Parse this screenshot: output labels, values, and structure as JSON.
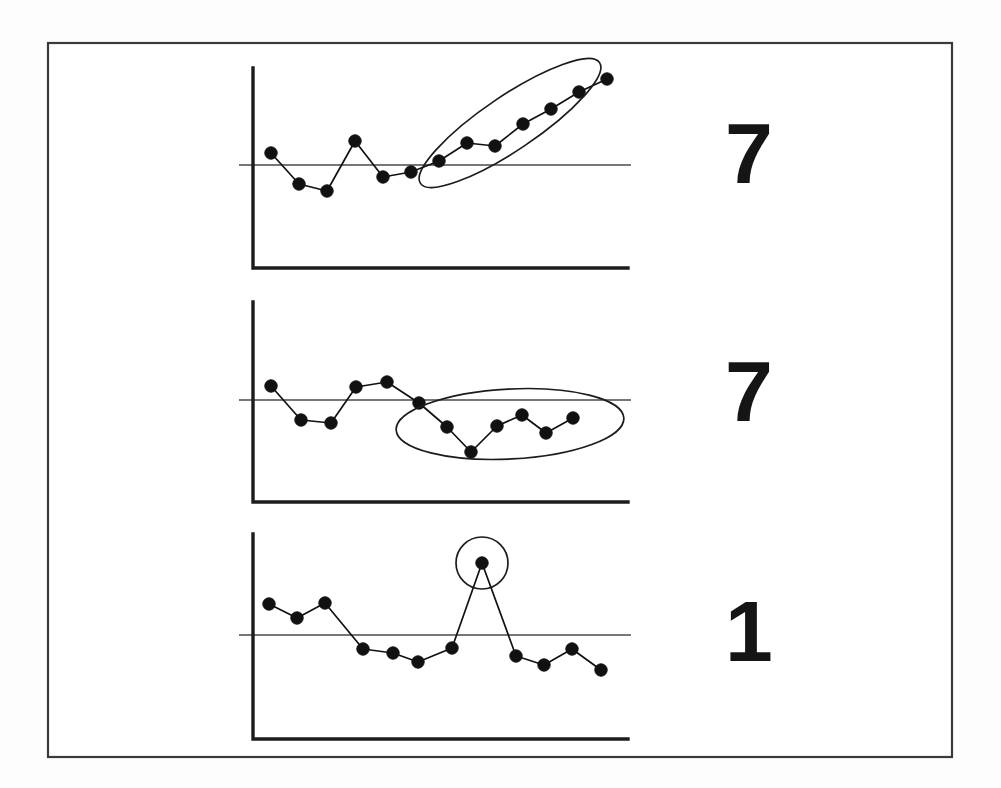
{
  "figure": {
    "background_color": "#ffffff",
    "frame_color": "#3a3a3a",
    "ink_color": "#111111",
    "reference_line_color": "#4a4a4a",
    "frame": {
      "x": 48,
      "y": 43,
      "width": 904,
      "height": 714
    }
  },
  "chart_data": [
    {
      "id": "panel-1",
      "type": "line",
      "title": "",
      "xlabel": "",
      "ylabel": "",
      "grid": false,
      "legend": "none",
      "reference_line": {
        "label": "baseline",
        "y_value": 0
      },
      "xlim": [
        0,
        15
      ],
      "ylim": [
        -2.6,
        6.2
      ],
      "x": [
        1,
        2,
        3,
        4,
        5,
        6,
        7,
        8,
        9,
        10,
        11,
        12,
        13,
        14
      ],
      "values": [
        0.7,
        -1.3,
        -1.7,
        1.1,
        -0.8,
        -0.5,
        0.1,
        1.2,
        1.1,
        2.4,
        3.3,
        4.6,
        5.3,
        0
      ],
      "series": [
        {
          "name": "signal",
          "values": [
            0.7,
            -1.3,
            -1.7,
            1.1,
            -0.8,
            -0.5,
            0.1,
            1.2,
            1.1,
            2.4,
            3.3,
            4.6,
            5.3
          ]
        }
      ],
      "annotation": {
        "kind": "ellipse",
        "description": "tilted ellipse enclosing rising trend segment",
        "cx": 510,
        "cy": 123,
        "rx": 108,
        "ry": 27,
        "rotation": -34,
        "covers_points": [
          6,
          7,
          8,
          9,
          10,
          11,
          12
        ]
      },
      "count_label": "7",
      "geometry": {
        "axis_x": 253,
        "axis_top": 68,
        "axis_bottom": 268,
        "axis_right": 628,
        "reference_y": 165,
        "points": [
          [
            271,
            153
          ],
          [
            299,
            184
          ],
          [
            327,
            191
          ],
          [
            355,
            141
          ],
          [
            383,
            177
          ],
          [
            411,
            172
          ],
          [
            439,
            161
          ],
          [
            467,
            143
          ],
          [
            495,
            146
          ],
          [
            523,
            124
          ],
          [
            551,
            109
          ],
          [
            579,
            92
          ],
          [
            607,
            79
          ]
        ]
      }
    },
    {
      "id": "panel-2",
      "type": "line",
      "title": "",
      "xlabel": "",
      "ylabel": "",
      "grid": false,
      "legend": "none",
      "reference_line": {
        "label": "baseline",
        "y_value": 0
      },
      "xlim": [
        0,
        15
      ],
      "ylim": [
        -3.4,
        4.0
      ],
      "x": [
        1,
        2,
        3,
        4,
        5,
        6,
        7,
        8,
        9,
        10,
        11,
        12,
        13,
        14
      ],
      "values": [
        0.5,
        -1.4,
        -1.5,
        0.6,
        0.8,
        -0.4,
        -1.4,
        -2.6,
        -1.5,
        -0.9,
        -1.7,
        -1.1,
        0,
        0
      ],
      "series": [
        {
          "name": "signal",
          "values": [
            0.5,
            -1.4,
            -1.5,
            0.6,
            0.8,
            -0.4,
            -1.4,
            -2.6,
            -1.5,
            -0.9,
            -1.7,
            -1.1
          ]
        }
      ],
      "annotation": {
        "kind": "ellipse",
        "description": "wide flattened ellipse enclosing dip segment",
        "cx": 510,
        "cy": 424,
        "rx": 114,
        "ry": 35,
        "rotation": -3,
        "covers_points": [
          5,
          6,
          7,
          8,
          9,
          10,
          11
        ]
      },
      "count_label": "7",
      "geometry": {
        "axis_x": 253,
        "axis_top": 302,
        "axis_bottom": 502,
        "axis_right": 628,
        "reference_y": 400,
        "points": [
          [
            271,
            386
          ],
          [
            301,
            420
          ],
          [
            331,
            423
          ],
          [
            356,
            387
          ],
          [
            387,
            382
          ],
          [
            419,
            403
          ],
          [
            447,
            427
          ],
          [
            471,
            452
          ],
          [
            497,
            426
          ],
          [
            522,
            415
          ],
          [
            546,
            433
          ],
          [
            573,
            418
          ]
        ]
      }
    },
    {
      "id": "panel-3",
      "type": "line",
      "title": "",
      "xlabel": "",
      "ylabel": "",
      "grid": false,
      "legend": "none",
      "reference_line": {
        "label": "baseline",
        "y_value": 0
      },
      "xlim": [
        0,
        15
      ],
      "ylim": [
        -2.4,
        5.2
      ],
      "x": [
        1,
        2,
        3,
        4,
        5,
        6,
        7,
        8,
        9,
        10,
        11,
        12,
        13,
        14
      ],
      "values": [
        1.2,
        0.8,
        1.3,
        -0.8,
        -1.0,
        -1.5,
        -0.6,
        4.5,
        -1.2,
        -1.6,
        -0.9,
        -1.8,
        0,
        0
      ],
      "series": [
        {
          "name": "signal",
          "values": [
            1.2,
            0.8,
            1.3,
            -0.8,
            -1.0,
            -1.5,
            -0.6,
            4.5,
            -1.2,
            -1.6,
            -0.9,
            -1.8
          ]
        }
      ],
      "annotation": {
        "kind": "circle",
        "description": "small circle highlighting single outlier spike",
        "cx": 482,
        "cy": 563,
        "r": 26,
        "rotation": 0,
        "covers_points": [
          7
        ]
      },
      "count_label": "1",
      "geometry": {
        "axis_x": 253,
        "axis_top": 534,
        "axis_bottom": 739,
        "axis_right": 628,
        "reference_y": 635,
        "points": [
          [
            269,
            604
          ],
          [
            297,
            618
          ],
          [
            325,
            603
          ],
          [
            363,
            649
          ],
          [
            393,
            653
          ],
          [
            418,
            662
          ],
          [
            452,
            648
          ],
          [
            482,
            563
          ],
          [
            516,
            656
          ],
          [
            544,
            665
          ],
          [
            572,
            649
          ],
          [
            601,
            670
          ]
        ]
      }
    }
  ],
  "labels": {
    "panel_1_count": "7",
    "panel_2_count": "7",
    "panel_3_count": "1"
  },
  "label_positions": [
    {
      "x": 748,
      "y": 160
    },
    {
      "x": 748,
      "y": 398
    },
    {
      "x": 748,
      "y": 638
    }
  ]
}
